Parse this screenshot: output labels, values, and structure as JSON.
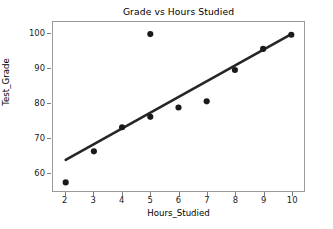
{
  "chart_data": {
    "type": "scatter",
    "title": "Grade vs Hours Studied",
    "xlabel": "Hours_Studied",
    "ylabel": "Test_Grade",
    "xlim": [
      1.55,
      10.45
    ],
    "ylim": [
      54.5,
      103.5
    ],
    "xticks": [
      2,
      3,
      4,
      5,
      6,
      7,
      8,
      9,
      10
    ],
    "xtick_labels": [
      "2",
      "3",
      "4",
      "5",
      "6",
      "7",
      "8",
      "9",
      "10"
    ],
    "yticks": [
      60,
      70,
      80,
      90,
      100
    ],
    "ytick_labels": [
      "60",
      "70",
      "80",
      "90",
      "100"
    ],
    "grid": false,
    "legend": null,
    "marker_color": "#1a1a1a",
    "line_color": "#262626",
    "points": [
      {
        "x": 2,
        "y": 57.0
      },
      {
        "x": 3,
        "y": 66.0
      },
      {
        "x": 4,
        "y": 73.0
      },
      {
        "x": 5,
        "y": 100.0
      },
      {
        "x": 5,
        "y": 76.0
      },
      {
        "x": 6,
        "y": 78.7
      },
      {
        "x": 7,
        "y": 80.5
      },
      {
        "x": 8,
        "y": 89.6
      },
      {
        "x": 9,
        "y": 95.7
      },
      {
        "x": 10,
        "y": 99.8
      }
    ],
    "series": [
      {
        "name": "Test_Grade",
        "type": "scatter",
        "x": [
          2,
          3,
          4,
          5,
          5,
          6,
          7,
          8,
          9,
          10
        ],
        "values": [
          57.0,
          66.0,
          73.0,
          100.0,
          76.0,
          78.7,
          80.5,
          89.6,
          95.7,
          99.8
        ]
      },
      {
        "name": "regression-line",
        "type": "line",
        "x": [
          2,
          10
        ],
        "values": [
          63.5,
          100.0
        ]
      }
    ]
  }
}
